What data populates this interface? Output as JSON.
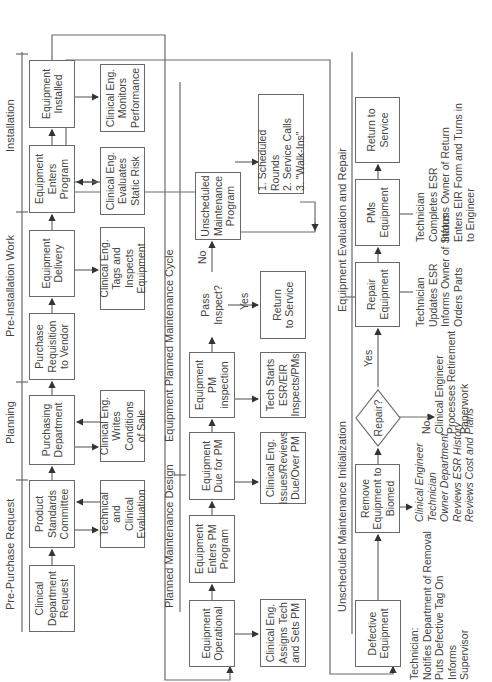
{
  "sections": {
    "pre_purchase": "Pre-Purchase Request",
    "planning": "Planning",
    "pre_installation": "Pre-Installation Work",
    "installation": "Installation",
    "planned_design": "Planned Maintenance Design",
    "planned_cycle": "Equipment Planned Maintenance Cycle",
    "unscheduled_init": "Unscheduled Maintenance Initialization",
    "evaluation_repair": "Equipment Evaluation and Repair"
  },
  "row1": {
    "clinical_request": "Clinical\nDepartment\nRequest",
    "standards_committee": "Product\nStandards\nCommittee",
    "technical_evaluation": "Technical and\nClinical\nEvaluation",
    "purchasing_department": "Purchasing\nDepartment",
    "writes_conditions": "Clinical Eng.\nWrites Conditions\nof Sale",
    "purchase_requisition": "Purchase\nRequisition\nto Vendor",
    "equipment_delivery": "Equipment\nDelivery",
    "tags_inspects": "Clinical Eng.\nTags and Inspects\nEquipment",
    "enters_program": "Equipment\nEnters\nProgram",
    "static_risk": "Clinical Eng.\nEvaluates\nStatic Risk",
    "installed": "Equipment\nInstalled",
    "monitors_performance": "Clinical Eng.\nMonitors\nPerformance"
  },
  "row2": {
    "operational": "Equipment\nOperational",
    "assigns_tech": "Clinical Eng.\nAssigns Tech\nand Sets PM",
    "enters_pm": "Equipment\nEnters PM\nProgram",
    "due_for_pm": "Equipment\nDue for PM",
    "issues_reviews": "Clinical Eng.\nIssues/Reviews\nDue/Over PM",
    "pm_inspection": "Equipment\nPM inspection",
    "tech_starts": "Tech Starts\nESR/EIR\nInspects/PMs",
    "pass_inspect": "Pass\nInspect?",
    "yes": "Yes",
    "no": "No",
    "return_service": "Return\nto Service",
    "unscheduled_program": "Unscheduled\nMaintenance\nProgram",
    "sources": "1. Scheduled Rounds\n2. Service Calls\n3. \"Walk-Ins\""
  },
  "row3": {
    "defective": "Defective\nEquipment",
    "technician_note": "Technician:\nNotifies Department of Removal\nPuts Defective Tag On\n          Informs\n          Supervisor",
    "remove_to_biomed": "Remove\nEquipment to\nBiomed",
    "review_note": "Clinical Engineer\nTechnician\nOwner Department\nReviews ESR History\nReviews Cost and Plans",
    "repair_question": "Repair?",
    "yes": "Yes",
    "no_note": "No--\nClinical Engineer\nProcesses Retirement\nPaperwork",
    "repair_equipment": "Repair\nEquipment",
    "repair_note": "Technician\nUpdates ESR\nInforms Owner of Status\nOrders Parts",
    "pms_equipment": "PMs\nEquipment",
    "pms_note": "Technician\nCompletes ESR\nInforms Owner of Return\nEnters EIR Form and Turns in\nto Engineer",
    "return_service": "Return to\nService"
  },
  "colors": {
    "line": "#6a6a6a",
    "text": "#444444",
    "background": "#ffffff"
  }
}
